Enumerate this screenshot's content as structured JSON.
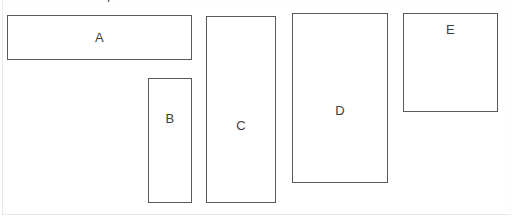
{
  "canvas": {
    "width": 513,
    "height": 222,
    "background_color": "#ffffff",
    "frame_color": "#e8e8e8"
  },
  "style": {
    "shape_border_color": "#5a5a5a",
    "shape_fill_color": "#ffffff",
    "label_color": "#3d3d3d"
  },
  "clipped_glyph": {
    "text": "4"
  },
  "shapes": [
    {
      "id": "a",
      "label": "A",
      "x": 7,
      "y": 15,
      "width": 185,
      "height": 45
    },
    {
      "id": "b",
      "label": "B",
      "x": 148,
      "y": 78,
      "width": 44,
      "height": 125
    },
    {
      "id": "c",
      "label": "C",
      "x": 206,
      "y": 16,
      "width": 70,
      "height": 187
    },
    {
      "id": "d",
      "label": "D",
      "x": 292,
      "y": 13,
      "width": 96,
      "height": 170
    },
    {
      "id": "e",
      "label": "E",
      "x": 403,
      "y": 13,
      "width": 95,
      "height": 99
    }
  ]
}
